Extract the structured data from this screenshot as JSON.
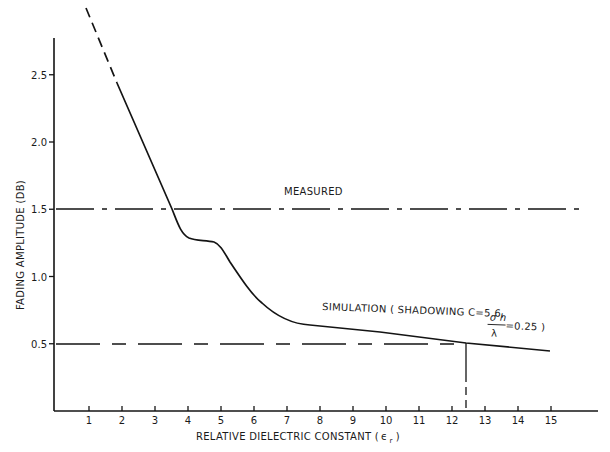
{
  "chart_data": {
    "type": "line",
    "title": "",
    "xlabel": "RELATIVE DIELECTRIC CONSTANT (ε r )",
    "xlabel_main": "RELATIVE DIELECTRIC CONSTANT (",
    "xlabel_symbol": "ϵ",
    "xlabel_sub": "r",
    "xlabel_close": ")",
    "ylabel": "FADING AMPLITUDE (DB)",
    "xlim": [
      0,
      16.5
    ],
    "ylim": [
      0,
      2.75
    ],
    "x_ticks": [
      1,
      2,
      3,
      4,
      5,
      6,
      7,
      8,
      9,
      10,
      11,
      12,
      13,
      14,
      15
    ],
    "x_tick_labels": [
      "1",
      "2",
      "3",
      "4",
      "5",
      "6",
      "7",
      "8",
      "9",
      "10",
      "11",
      "12",
      "13",
      "14",
      "15"
    ],
    "y_ticks": [
      0.5,
      1.0,
      1.5,
      2.0,
      2.5
    ],
    "y_tick_labels": [
      "0.5",
      "1.0",
      "1.5",
      "2.0",
      "2.5"
    ],
    "grid": false,
    "series": [
      {
        "name": "SIMULATION ( SHADOWING C=5.6, σh/λ=0.25 )",
        "style": "solid (dashed extrapolation above ~2.4 dB)",
        "x": [
          0.9,
          2.0,
          3.0,
          3.6,
          3.9,
          4.3,
          4.9,
          5.3,
          6.0,
          6.6,
          7.1,
          7.7,
          9.0,
          10.0,
          11.0,
          12.0,
          12.5,
          13.0,
          14.0,
          15.0
        ],
        "y": [
          2.95,
          2.4,
          1.9,
          1.5,
          1.3,
          1.26,
          1.24,
          1.09,
          0.9,
          0.76,
          0.68,
          0.63,
          0.6,
          0.58,
          0.55,
          0.52,
          0.51,
          0.5,
          0.48,
          0.45
        ]
      },
      {
        "name": "MEASURED",
        "style": "dash-dot horizontal",
        "x": [
          0,
          16
        ],
        "y": [
          1.5,
          1.5
        ]
      },
      {
        "name": "0.5 dB reference",
        "style": "dashed horizontal",
        "x": [
          0,
          12.5
        ],
        "y": [
          0.5,
          0.5
        ]
      },
      {
        "name": "εr = 12.5 marker",
        "style": "vertical solid/dashed",
        "x": [
          12.5,
          12.5
        ],
        "y": [
          0,
          0.5
        ]
      }
    ],
    "annotations": [
      {
        "text": "MEASURED",
        "x": 7.0,
        "y": 1.6
      },
      {
        "text": "SIMULATION ( SHADOWING C=5.6,",
        "x": 8.3,
        "y": 0.63
      },
      {
        "text": "σh/λ = 0.25 )",
        "x": 13.0,
        "y": 0.58
      }
    ],
    "legend": "none (inline annotations)"
  },
  "labels": {
    "measured": "MEASURED",
    "simulation_main": "SIMULATION ( SHADOWING C=5.6,",
    "sigma_h": "σ h",
    "lambda": "λ",
    "ratio_value": "=0.25 )"
  }
}
